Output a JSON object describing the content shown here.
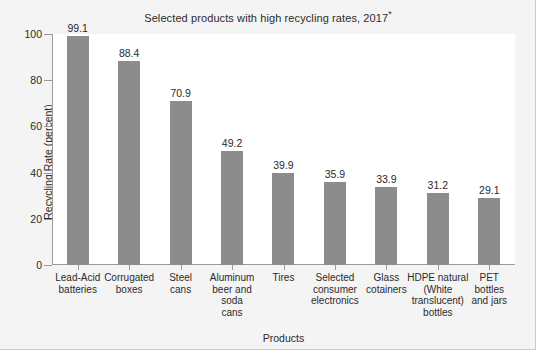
{
  "chart_data": {
    "type": "bar",
    "title": "Selected products with high recycling rates, 2017",
    "title_footnote_marker": "*",
    "xlabel": "Products",
    "ylabel": "Recycling Rate (percent)",
    "ylim": [
      0,
      100
    ],
    "yticks": [
      0,
      20,
      40,
      60,
      80,
      100
    ],
    "ytick_labels": [
      "0",
      "20",
      "40",
      "60",
      "80",
      "100"
    ],
    "grid": false,
    "legend": "none",
    "bar_color": "#8c8c8c",
    "plot_background": "#ffffff",
    "figure_background": "#f4f4f4",
    "text_color": "#2b2b2b",
    "axis_color": "#9a9a9a",
    "categories": [
      "Lead-Acid batteries",
      "Corrugated boxes",
      "Steel cans",
      "Aluminum beer and soda cans",
      "Tires",
      "Selected consumer electronics",
      "Glass cotainers",
      "HDPE natural (White translucent) bottles",
      "PET bottles and jars"
    ],
    "category_label_lines": [
      [
        "Lead-Acid",
        "batteries"
      ],
      [
        "Corrugated",
        "boxes"
      ],
      [
        "Steel",
        "cans"
      ],
      [
        "Aluminum",
        "beer and soda",
        "cans"
      ],
      [
        "Tires"
      ],
      [
        "Selected",
        "consumer",
        "electronics"
      ],
      [
        "Glass",
        "cotainers"
      ],
      [
        "HDPE natural",
        "(White",
        "translucent)",
        "bottles"
      ],
      [
        "PET",
        "bottles",
        "and jars"
      ]
    ],
    "values": [
      99.1,
      88.4,
      70.9,
      49.2,
      39.9,
      35.9,
      33.9,
      31.2,
      29.1
    ],
    "value_labels": [
      "99.1",
      "88.4",
      "70.9",
      "49.2",
      "39.9",
      "35.9",
      "33.9",
      "31.2",
      "29.1"
    ]
  }
}
